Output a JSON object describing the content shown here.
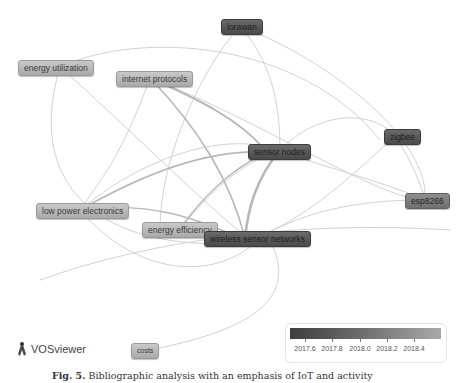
{
  "app": {
    "name": "VOSviewer",
    "logo_icon": "vosviewer-logo-icon"
  },
  "network": {
    "type": "keyword co-occurrence overlay visualization",
    "nodes": [
      {
        "id": "lorawan",
        "label": "lorawan",
        "x": 221,
        "y": 19,
        "shade": "dark"
      },
      {
        "id": "energy-utilization",
        "label": "energy utilization",
        "x": 18,
        "y": 60,
        "shade": "light"
      },
      {
        "id": "internet-protocols",
        "label": "internet protocols",
        "x": 116,
        "y": 71,
        "shade": "light"
      },
      {
        "id": "sensor-nodes",
        "label": "sensor nodes",
        "x": 248,
        "y": 144,
        "shade": "dark"
      },
      {
        "id": "zigbee",
        "label": "zigbee",
        "x": 384,
        "y": 129,
        "shade": "dark"
      },
      {
        "id": "esp8266",
        "label": "esp8266",
        "x": 405,
        "y": 193,
        "shade": "mid"
      },
      {
        "id": "low-power-electronics",
        "label": "low power electronics",
        "x": 36,
        "y": 203,
        "shade": "light"
      },
      {
        "id": "energy-efficiency",
        "label": "energy efficiency",
        "x": 142,
        "y": 222,
        "shade": "light"
      },
      {
        "id": "wireless-sensor-networks",
        "label": "wireless sensor networks",
        "x": 204,
        "y": 231,
        "shade": "dark"
      },
      {
        "id": "costs",
        "label": "costs",
        "x": 131,
        "y": 343,
        "shade": "light"
      }
    ]
  },
  "legend": {
    "title": "",
    "gradient": [
      "#3e3e3e",
      "#6b6b6b",
      "#a8a8a8"
    ],
    "ticks": [
      "2017.6",
      "2017.8",
      "2018.0",
      "2018.2",
      "2018.4"
    ]
  },
  "caption": {
    "label": "Fig. 5.",
    "text": "Bibliographic analysis with an emphasis of IoT and activity"
  }
}
